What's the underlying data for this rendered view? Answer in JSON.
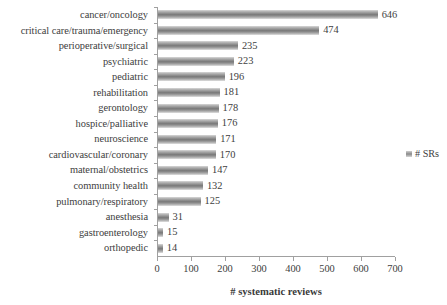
{
  "chart_data": {
    "type": "bar",
    "orientation": "horizontal",
    "title": "",
    "xlabel": "# systematic reviews",
    "ylabel": "",
    "xlim": [
      0,
      700
    ],
    "xticks": [
      0,
      100,
      200,
      300,
      400,
      500,
      600,
      700
    ],
    "grid": false,
    "legend_position": "right",
    "categories": [
      "cancer/oncology",
      "critical care/trauma/emergency",
      "perioperative/surgical",
      "psychiatric",
      "pediatric",
      "rehabilitation",
      "gerontology",
      "hospice/palliative",
      "neuroscience",
      "cardiovascular/coronary",
      "maternal/obstetrics",
      "community health",
      "pulmonary/respiratory",
      "anesthesia",
      "gastroenterology",
      "orthopedic"
    ],
    "values": [
      646,
      474,
      235,
      223,
      196,
      181,
      178,
      176,
      171,
      170,
      147,
      132,
      125,
      31,
      15,
      14
    ],
    "series": [
      {
        "name": "# SRs",
        "values": [
          646,
          474,
          235,
          223,
          196,
          181,
          178,
          176,
          171,
          170,
          147,
          132,
          125,
          31,
          15,
          14
        ]
      }
    ],
    "data_labels": [
      "646",
      "474",
      "235",
      "223",
      "196",
      "181",
      "178",
      "176",
      "171",
      "170",
      "147",
      "132",
      "125",
      "31",
      "15",
      "14"
    ],
    "xtick_labels": [
      "0",
      "100",
      "200",
      "300",
      "400",
      "500",
      "600",
      "700"
    ],
    "legend_entries": [
      "# SRs"
    ],
    "colors": {
      "bar_light": "#d9d9d9",
      "bar_dark": "#7a7a7a",
      "axis": "#a0a0a0",
      "text": "#404040",
      "background": "#ffffff"
    }
  }
}
